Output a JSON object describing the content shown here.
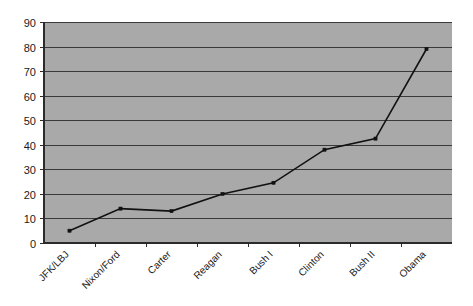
{
  "chart_data": {
    "type": "line",
    "title": "",
    "subtitle": "",
    "xlabel": "",
    "ylabel": "",
    "categories": [
      "JFK/LBJ",
      "Nixon/Ford",
      "Carter",
      "Reagan",
      "Bush I",
      "Clinton",
      "Bush II",
      "Obama"
    ],
    "values": [
      5,
      14,
      13,
      20,
      24.5,
      38,
      42.5,
      79
    ],
    "series": [
      {
        "name": "",
        "values": [
          5,
          14,
          13,
          20,
          24.5,
          38,
          42.5,
          79
        ]
      }
    ],
    "ylim": [
      0,
      90
    ],
    "ytick_labels": [
      "0",
      "10",
      "20",
      "30",
      "40",
      "50",
      "60",
      "70",
      "80",
      "90"
    ],
    "ytick_values": [
      0,
      10,
      20,
      30,
      40,
      50,
      60,
      70,
      80,
      90
    ],
    "grid": true,
    "grid_axis": "y",
    "legend": false,
    "legend_position": "none",
    "marker": "square",
    "xtick_label_rotation": -45,
    "colors": {
      "plot_background": "#a9a9a9",
      "page_background": "#ffffff",
      "gridline": "#3a3a3a",
      "axis": "#2b2b2b",
      "series_line": "#111111",
      "text": "#1a1a1a"
    }
  }
}
